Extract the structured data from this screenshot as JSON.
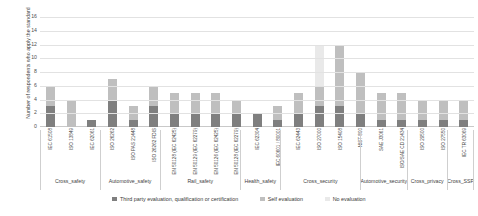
{
  "chart_data": {
    "type": "bar",
    "subtype": "stacked-bar-grouped",
    "title": "",
    "xlabel": "",
    "ylabel": "Number of respondents who apply the standard",
    "ylim": [
      0,
      16
    ],
    "ytick_step": 2,
    "yticks": [
      "0",
      "2",
      "4",
      "6",
      "8",
      "10",
      "12",
      "14",
      "16"
    ],
    "grid": true,
    "legend_position": "bottom",
    "categories": [
      "IEC 61508",
      "ISO 13849",
      "IEC 62061",
      "ISO 26262",
      "ISO PAS 21448",
      "ISO 26262 FDIS",
      "EN 50128 (IEC 62425)",
      "EN 50129 (IEC 62279)",
      "EN 50126 (IEC 62425)",
      "EN 50128 (IEC 62279)",
      "IEC 62304",
      "IEC 60601 / 80001",
      "IEC 62443",
      "ISO 27000",
      "ISO 15408",
      "NIST 800",
      "SAE J3061",
      "ISO/SAE CD 21434",
      "ISO 29500",
      "ISO 27550",
      "IEC TR 63069"
    ],
    "series": [
      {
        "name": "Third party evaluation, qualification or certification",
        "color": "#7f7f7f",
        "values": [
          3,
          0,
          1,
          4,
          1,
          3,
          2,
          2,
          2,
          2,
          2,
          1,
          2,
          3,
          3,
          2,
          1,
          1,
          1,
          1,
          1
        ]
      },
      {
        "name": "Self evaluation",
        "color": "#bfbfbf",
        "values": [
          3,
          4,
          0,
          3,
          2,
          3,
          3,
          3,
          3,
          2,
          0,
          2,
          3,
          3,
          9,
          6,
          4,
          4,
          3,
          3,
          3
        ]
      },
      {
        "name": "No evaluation",
        "color": "#e9e9e9",
        "values": [
          0,
          0,
          0,
          0,
          0,
          0,
          0,
          0,
          0,
          0,
          0,
          0,
          0,
          6,
          0,
          0,
          0,
          0,
          0,
          0,
          0
        ]
      }
    ],
    "groups": [
      {
        "label": "Cross_safety",
        "span": 3
      },
      {
        "label": "Automotive_safety",
        "span": 3
      },
      {
        "label": "Rail_safety",
        "span": 4
      },
      {
        "label": "Health_safety",
        "span": 2
      },
      {
        "label": "Cross_security",
        "span": 4
      },
      {
        "label": "Automotive_security",
        "span": 2
      },
      {
        "label": "Cross_privacy",
        "span": 2
      },
      {
        "label": "Cross_SSP",
        "span": 1
      }
    ]
  },
  "colors": {
    "third_party": "#7f7f7f",
    "self_evaluation": "#bfbfbf",
    "no_evaluation": "#e9e9e9",
    "grid": "#e2e2e2",
    "axis": "#c9c9c9"
  }
}
